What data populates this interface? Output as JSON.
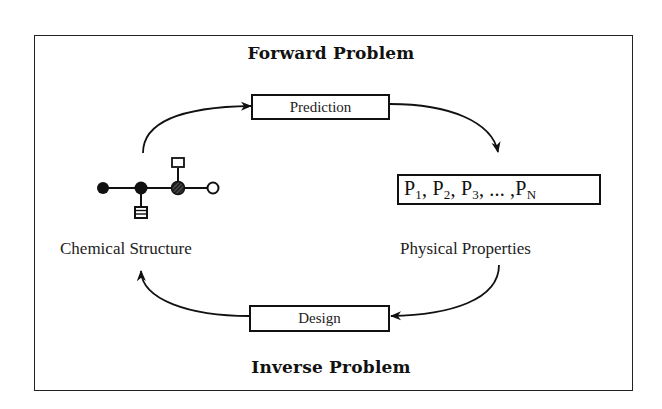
{
  "diagram": {
    "forward_heading": "Forward Problem",
    "inverse_heading": "Inverse Problem",
    "prediction_label": "Prediction",
    "design_label": "Design",
    "chemical_structure_label": "Chemical Structure",
    "physical_properties_label": "Physical Properties",
    "properties": {
      "p1": "P",
      "p1_sub": "1",
      "p2": "P",
      "p2_sub": "2",
      "p3": "P",
      "p3_sub": "3",
      "ellipsis": "...",
      "pn": "P",
      "pn_sub": "N"
    },
    "molecule": {
      "nodes": [
        {
          "id": "n1",
          "style": "filled"
        },
        {
          "id": "n2",
          "style": "filled"
        },
        {
          "id": "n3",
          "style": "hatched"
        },
        {
          "id": "n4",
          "style": "hollow"
        }
      ],
      "substituents": [
        {
          "on": "n2",
          "position": "below",
          "style": "striped-square"
        },
        {
          "on": "n3",
          "position": "above",
          "style": "hollow-square"
        }
      ]
    },
    "flows": [
      {
        "from": "Chemical Structure",
        "via": "Prediction",
        "to": "Physical Properties"
      },
      {
        "from": "Physical Properties",
        "via": "Design",
        "to": "Chemical Structure"
      }
    ]
  }
}
